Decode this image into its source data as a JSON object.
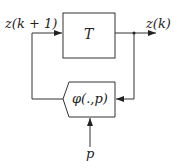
{
  "diagram": {
    "blocks": {
      "T": {
        "label": "T"
      },
      "phi": {
        "label": "φ(.,p)"
      }
    },
    "signals": {
      "input": "z(k + 1)",
      "output": "z(k)",
      "parameter": "p"
    },
    "colors": {
      "line": "#333333",
      "background": "#ffffff"
    }
  }
}
